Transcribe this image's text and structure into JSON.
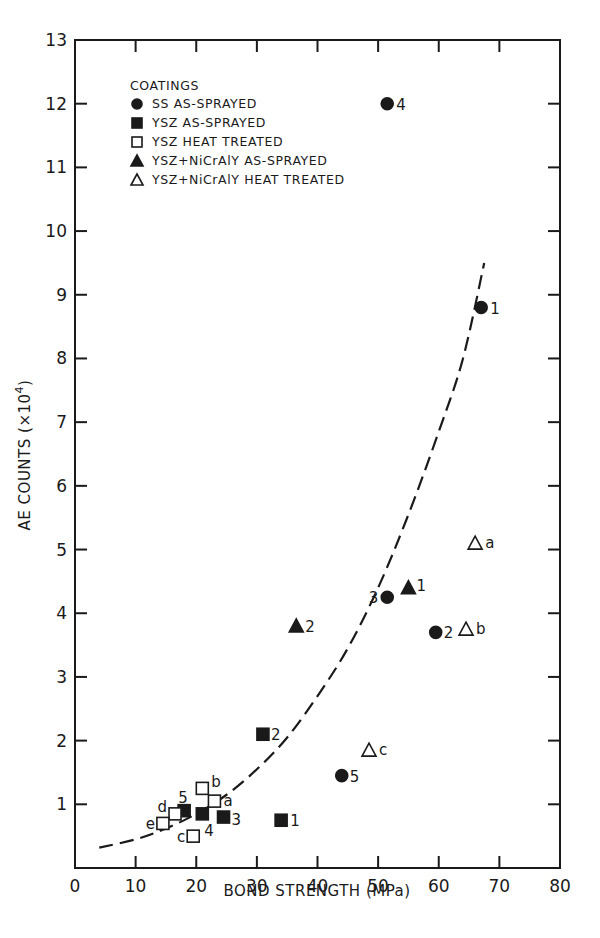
{
  "chart_data": {
    "type": "scatter",
    "title": "",
    "xlabel": "BOND STRENGTH (MPa)",
    "ylabel": "AE COUNTS (×10⁴)",
    "xlim": [
      0,
      80
    ],
    "ylim": [
      0,
      13
    ],
    "x_ticks": [
      0,
      10,
      20,
      30,
      40,
      50,
      60,
      70,
      80
    ],
    "y_ticks": [
      0,
      1,
      2,
      3,
      4,
      5,
      6,
      7,
      8,
      9,
      10,
      11,
      12,
      13
    ],
    "grid": false,
    "legend_position": "upper-left",
    "legend_title": "COATINGS",
    "series": [
      {
        "name": "SS AS-SPRAYED",
        "marker": "filled-circle",
        "points": [
          {
            "label": "1",
            "x": 67,
            "y": 8.8
          },
          {
            "label": "2",
            "x": 59.5,
            "y": 3.7
          },
          {
            "label": "3",
            "x": 51.5,
            "y": 4.25
          },
          {
            "label": "4",
            "x": 51.5,
            "y": 12.0
          },
          {
            "label": "5",
            "x": 44,
            "y": 1.45
          }
        ]
      },
      {
        "name": "YSZ AS-SPRAYED",
        "marker": "filled-square",
        "points": [
          {
            "label": "1",
            "x": 34,
            "y": 0.75
          },
          {
            "label": "2",
            "x": 31,
            "y": 2.1
          },
          {
            "label": "3",
            "x": 24.5,
            "y": 0.8
          },
          {
            "label": "4",
            "x": 21,
            "y": 0.85
          },
          {
            "label": "5",
            "x": 18,
            "y": 0.9
          }
        ]
      },
      {
        "name": "YSZ HEAT TREATED",
        "marker": "open-square",
        "points": [
          {
            "label": "a",
            "x": 23,
            "y": 1.05
          },
          {
            "label": "b",
            "x": 21,
            "y": 1.25
          },
          {
            "label": "c",
            "x": 19.5,
            "y": 0.5
          },
          {
            "label": "d",
            "x": 16.5,
            "y": 0.85
          },
          {
            "label": "e",
            "x": 14.5,
            "y": 0.7
          }
        ]
      },
      {
        "name": "YSZ+NiCrAlY AS-SPRAYED",
        "marker": "filled-triangle",
        "points": [
          {
            "label": "1",
            "x": 55,
            "y": 4.4
          },
          {
            "label": "2",
            "x": 36.5,
            "y": 3.8
          }
        ]
      },
      {
        "name": "YSZ+NiCrAlY HEAT TREATED",
        "marker": "open-triangle",
        "points": [
          {
            "label": "a",
            "x": 66,
            "y": 5.1
          },
          {
            "label": "b",
            "x": 64.5,
            "y": 3.75
          },
          {
            "label": "c",
            "x": 48.5,
            "y": 1.85
          }
        ]
      }
    ],
    "trend_curve": {
      "style": "dashed",
      "description": "exponential-like fit curve",
      "points": [
        [
          4,
          0.32
        ],
        [
          10,
          0.45
        ],
        [
          15,
          0.62
        ],
        [
          20,
          0.85
        ],
        [
          25,
          1.15
        ],
        [
          30,
          1.55
        ],
        [
          35,
          2.05
        ],
        [
          40,
          2.7
        ],
        [
          45,
          3.45
        ],
        [
          50,
          4.4
        ],
        [
          55,
          5.55
        ],
        [
          60,
          6.85
        ],
        [
          64,
          8.0
        ],
        [
          67.5,
          9.5
        ]
      ]
    }
  },
  "legend": {
    "title": "COATINGS",
    "items": [
      {
        "marker": "filled-circle",
        "label": "SS AS-SPRAYED"
      },
      {
        "marker": "filled-square",
        "label": "YSZ AS-SPRAYED"
      },
      {
        "marker": "open-square",
        "label": "YSZ HEAT TREATED"
      },
      {
        "marker": "filled-triangle",
        "label": "YSZ+NiCrAlY AS-SPRAYED"
      },
      {
        "marker": "open-triangle",
        "label": "YSZ+NiCrAlY HEAT TREATED"
      }
    ]
  },
  "axes": {
    "x_title": "BOND STRENGTH (MPa)",
    "y_title_main": "AE COUNTS (×10",
    "y_title_sup": "4",
    "y_title_end": ")"
  },
  "colors": {
    "ink": "#1a1a1a",
    "background": "#ffffff"
  }
}
